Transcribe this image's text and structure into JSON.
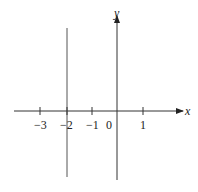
{
  "diagram": {
    "axes": {
      "x_label": "x",
      "y_label": "y",
      "origin_label": "0"
    },
    "x_ticks": [
      {
        "value": -3,
        "label": "−3"
      },
      {
        "value": -2,
        "label": "−2"
      },
      {
        "value": -1,
        "label": "−1"
      },
      {
        "value": 1,
        "label": "1"
      }
    ],
    "line": {
      "equation": "x = -2",
      "color": "#555555"
    },
    "axis_color": "#333333"
  }
}
